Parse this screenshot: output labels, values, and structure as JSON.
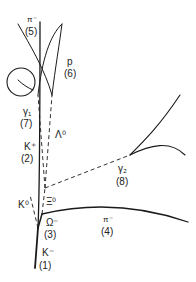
{
  "diagram": {
    "type": "bubble-chamber-event",
    "line_color": "#1a1a1a",
    "tracks": [
      {
        "id": 1,
        "particle": "K⁻",
        "num": "(1)",
        "style": "solid"
      },
      {
        "id": 2,
        "particle": "K⁺",
        "num": "(2)",
        "style": "solid"
      },
      {
        "id": 3,
        "particle": "Ω⁻",
        "num": "(3)",
        "style": "solid"
      },
      {
        "id": 4,
        "particle": "π⁻",
        "num": "(4)",
        "style": "solid"
      },
      {
        "id": 5,
        "particle": "π⁻",
        "num": "(5)",
        "style": "solid"
      },
      {
        "id": 6,
        "particle": "p",
        "num": "(6)",
        "style": "solid"
      },
      {
        "id": 7,
        "particle": "γ₁",
        "num": "(7)",
        "style": "solid"
      },
      {
        "id": 8,
        "particle": "γ₂",
        "num": "(8)",
        "style": "dashed"
      },
      {
        "id": 9,
        "particle": "K⁰",
        "num": "",
        "style": "dashed"
      },
      {
        "id": 10,
        "particle": "Ξ⁰",
        "num": "",
        "style": "dashed"
      },
      {
        "id": 11,
        "particle": "Λ⁰",
        "num": "",
        "style": "dashed"
      }
    ]
  }
}
